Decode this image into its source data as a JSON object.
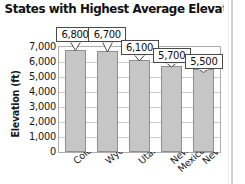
{
  "chart_data": {
    "type": "bar",
    "title": "States with Highest Average Elevation",
    "xlabel": "",
    "ylabel": "Elevation (ft)",
    "categories": [
      "Colorado",
      "Wyoming",
      "Utah",
      "New Mexico",
      "Nevada"
    ],
    "values": [
      6800,
      6700,
      6100,
      5700,
      5500
    ],
    "data_labels": [
      "6,800",
      "6,700",
      "6,100",
      "5,700",
      "5,500"
    ],
    "ylim": [
      0,
      7000
    ],
    "ytick_values": [
      7000,
      6000,
      5000,
      4000,
      3000,
      2000,
      1000,
      0
    ],
    "ytick_labels": [
      "7,000",
      "6,000",
      "5,000",
      "4,000",
      "3,000",
      "2,000",
      "1,000",
      "0"
    ],
    "grid": true,
    "legend": "none",
    "bar_color": "#c6c6c6",
    "bar_border_color": "#8f8f8f"
  },
  "category_label_lines": [
    [
      "Colorado"
    ],
    [
      "Wyoming"
    ],
    [
      "Utah"
    ],
    [
      "New",
      "Mexico"
    ],
    [
      "Nevada"
    ]
  ]
}
